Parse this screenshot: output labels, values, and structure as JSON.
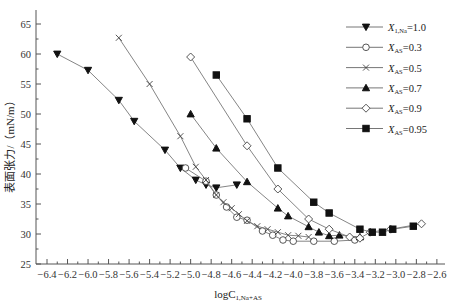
{
  "chart_data": {
    "type": "line",
    "title": "",
    "xlabel": "logC",
    "xlabel_sub": "1,Na+AS",
    "ylabel": "表面张力/（mN/m）",
    "xlim": [
      -6.5,
      -2.55
    ],
    "ylim": [
      25,
      67
    ],
    "xticks": [
      -6.4,
      -6.2,
      -6.0,
      -5.8,
      -5.6,
      -5.4,
      -5.2,
      -5.0,
      -4.8,
      -4.6,
      -4.4,
      -4.2,
      -4.0,
      -3.8,
      -3.6,
      -3.4,
      -3.2,
      -3.0,
      -2.8,
      -2.6
    ],
    "yticks": [
      25,
      30,
      35,
      40,
      45,
      50,
      55,
      60,
      65
    ],
    "grid": false,
    "legend_position": "upper right",
    "series": [
      {
        "name": "X_1,Na=1.0",
        "var": "X",
        "sub": "1,Na",
        "value": "=1.0",
        "marker": "triangle-down-filled",
        "x": [
          -6.3,
          -6.0,
          -5.7,
          -5.55,
          -5.25,
          -5.1,
          -4.95,
          -4.85,
          -4.75,
          -4.55
        ],
        "y": [
          60.0,
          57.3,
          52.3,
          48.8,
          44.0,
          41.0,
          39.0,
          38.2,
          37.7,
          38.2
        ]
      },
      {
        "name": "X_AS=0.3",
        "var": "X",
        "sub": "AS",
        "value": "=0.3",
        "marker": "circle-open",
        "x": [
          -5.05,
          -4.85,
          -4.75,
          -4.65,
          -4.55,
          -4.45,
          -4.3,
          -4.2,
          -4.1,
          -4.0,
          -3.8,
          -3.6,
          -3.4
        ],
        "y": [
          41.0,
          38.8,
          36.5,
          34.5,
          32.8,
          32.3,
          30.5,
          29.8,
          29.0,
          28.8,
          28.8,
          28.8,
          29.0
        ]
      },
      {
        "name": "X_AS=0.5",
        "var": "X",
        "sub": "AS",
        "value": "=0.5",
        "marker": "cross",
        "x": [
          -5.7,
          -5.4,
          -5.1,
          -4.95,
          -4.85,
          -4.75,
          -4.68,
          -4.6,
          -4.53,
          -4.45,
          -4.35,
          -4.25,
          -4.15,
          -4.05,
          -3.95,
          -3.85
        ],
        "y": [
          62.7,
          55.0,
          46.3,
          41.2,
          39.0,
          36.5,
          35.3,
          34.3,
          33.3,
          32.2,
          31.3,
          30.8,
          30.3,
          29.8,
          29.7,
          29.5
        ]
      },
      {
        "name": "X_AS=0.7",
        "var": "X",
        "sub": "AS",
        "value": "=0.7",
        "marker": "triangle-up-filled",
        "x": [
          -5.0,
          -4.75,
          -4.45,
          -4.15,
          -4.05,
          -3.85,
          -3.75,
          -3.65,
          -3.55,
          -3.35
        ],
        "y": [
          50.0,
          44.3,
          38.7,
          34.3,
          33.0,
          31.2,
          30.3,
          29.7,
          29.8,
          29.5
        ]
      },
      {
        "name": "X_AS=0.9",
        "var": "X",
        "sub": "AS",
        "value": "=0.9",
        "marker": "diamond-open",
        "x": [
          -5.0,
          -4.45,
          -4.15,
          -3.85,
          -3.65,
          -3.45,
          -3.35,
          -3.25,
          -3.05,
          -2.75
        ],
        "y": [
          59.5,
          44.7,
          37.5,
          32.5,
          30.8,
          29.5,
          29.3,
          30.3,
          30.8,
          31.7
        ]
      },
      {
        "name": "X_AS=0.95",
        "var": "X",
        "sub": "AS",
        "value": "=0.95",
        "marker": "square-filled",
        "x": [
          -4.75,
          -4.45,
          -4.15,
          -3.8,
          -3.65,
          -3.35,
          -3.23,
          -3.13,
          -3.03,
          -2.83
        ],
        "y": [
          56.5,
          49.2,
          41.0,
          35.3,
          33.5,
          30.8,
          30.3,
          30.3,
          30.8,
          31.3
        ]
      }
    ]
  }
}
